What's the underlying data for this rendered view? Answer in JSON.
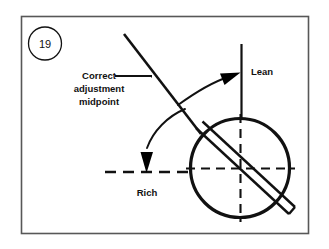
{
  "figure": {
    "number": "19",
    "frame": {
      "border_color": "#585858",
      "background_color": "#ffffff",
      "x": 21,
      "y": 16,
      "width": 287,
      "height": 217
    },
    "ink_color": "#111111",
    "labels": {
      "correct_line1": "Correct",
      "correct_line2": "adjustment",
      "correct_line3": "midpoint",
      "lean": "Lean",
      "rich": "Rich"
    },
    "icons": {
      "lean_arrow": "curved-arrow-right-icon",
      "rich_arrow": "curved-arrow-down-icon",
      "leader": "leader-line-icon",
      "blade": "diagonal-blade-icon",
      "dial": "circle-dial-icon",
      "crosshair_v": "dashed-vertical-crosshair-icon",
      "crosshair_h": "dashed-horizontal-crosshair-icon",
      "reference_vertical": "vertical-reference-line-icon",
      "reference_horizontal": "dashed-horizontal-reference-line-icon",
      "badge": "figure-number-badge-icon"
    },
    "geometry": {
      "dial_center_x": 240,
      "dial_center_y": 168,
      "dial_radius": 50,
      "blade_angle_note": "diagonal from upper-left to lower-right",
      "vertical_ref_x": 241,
      "horizontal_ref_y": 172
    }
  }
}
